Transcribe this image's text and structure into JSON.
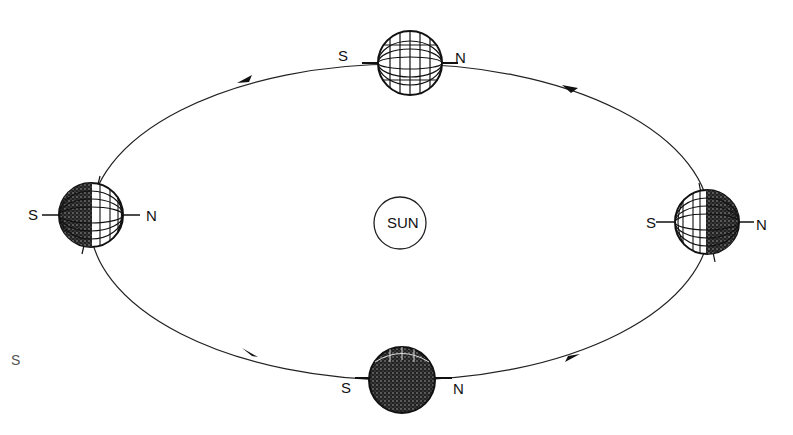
{
  "diagram": {
    "sun_label": "SUN",
    "poles": {
      "south": "S",
      "north": "N"
    },
    "orbit_direction": "counter-clockwise",
    "earths": [
      {
        "position": "top",
        "shading": "north-pole-lit-edge"
      },
      {
        "position": "left",
        "shading": "south-half-dark"
      },
      {
        "position": "right",
        "shading": "north-half-dark"
      },
      {
        "position": "bottom",
        "shading": "mostly-dark"
      }
    ],
    "edge_fragment": "S"
  }
}
